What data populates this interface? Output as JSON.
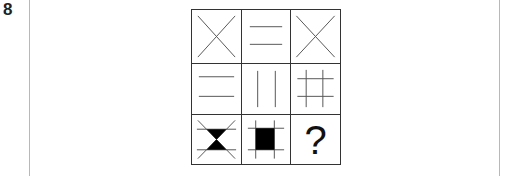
{
  "question": {
    "number": "8",
    "missing_symbol": "?"
  },
  "matrix": {
    "rows": 3,
    "cols": 3,
    "cells": [
      {
        "row": 1,
        "col": 1,
        "figure": "diagonal-cross"
      },
      {
        "row": 1,
        "col": 2,
        "figure": "two-horizontal-lines"
      },
      {
        "row": 1,
        "col": 3,
        "figure": "diagonal-cross"
      },
      {
        "row": 2,
        "col": 1,
        "figure": "two-horizontal-lines"
      },
      {
        "row": 2,
        "col": 2,
        "figure": "two-vertical-lines"
      },
      {
        "row": 2,
        "col": 3,
        "figure": "hash-grid"
      },
      {
        "row": 3,
        "col": 1,
        "figure": "hourglass-with-lines"
      },
      {
        "row": 3,
        "col": 2,
        "figure": "filled-square-hash"
      },
      {
        "row": 3,
        "col": 3,
        "figure": "question-mark"
      }
    ]
  },
  "colors": {
    "line": "#555555",
    "fill": "#000000",
    "frame_border": "#b8b8b8"
  }
}
